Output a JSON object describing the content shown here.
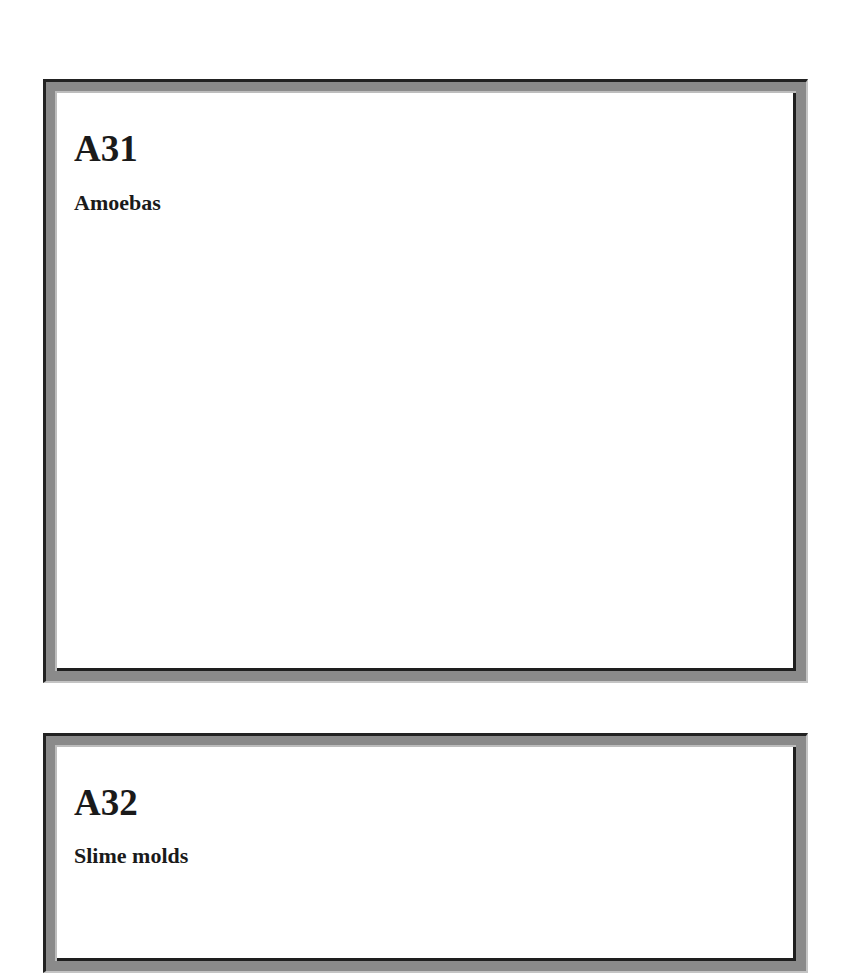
{
  "cards": [
    {
      "code": "A31",
      "label": "Amoebas"
    },
    {
      "code": "A32",
      "label": "Slime molds"
    }
  ],
  "colors": {
    "frame_dark": "#1e1e1e",
    "frame_mid": "#8a8a8a",
    "frame_light": "#c4c4c4",
    "background": "#ffffff",
    "text": "#1a1a1a"
  }
}
